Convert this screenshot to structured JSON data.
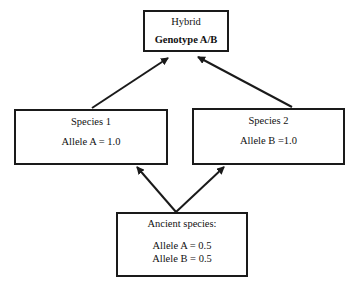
{
  "diagram": {
    "type": "flow",
    "nodes": {
      "hybrid": {
        "title": "Hybrid",
        "genotype": "Genotype A/B"
      },
      "species1": {
        "title": "Species 1",
        "allele": "Allele A = 1.0"
      },
      "species2": {
        "title": "Species 2",
        "allele": "Allele B =1.0"
      },
      "ancient": {
        "title": "Ancient species:",
        "allele_a": "Allele A = 0.5",
        "allele_b": "Allele B = 0.5"
      }
    },
    "edges": [
      {
        "from": "ancient",
        "to": "species1"
      },
      {
        "from": "ancient",
        "to": "species2"
      },
      {
        "from": "species1",
        "to": "hybrid"
      },
      {
        "from": "species2",
        "to": "hybrid"
      }
    ],
    "colors": {
      "stroke": "#1a1a1a",
      "background": "#ffffff"
    }
  }
}
